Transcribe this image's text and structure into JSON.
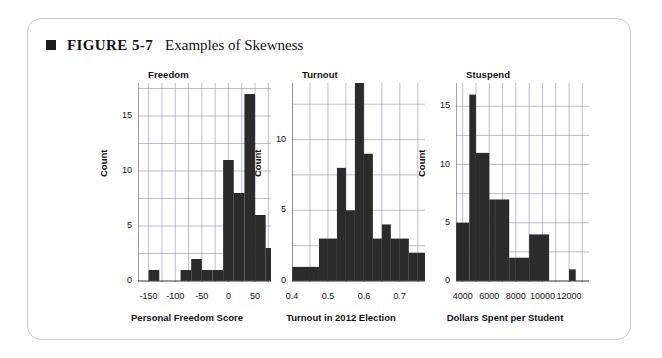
{
  "figure": {
    "bullet": "square-bullet",
    "number": "FIGURE 5-7",
    "title": "Examples of Skewness"
  },
  "chart_data": [
    {
      "type": "bar",
      "title": "Freedom",
      "xlabel": "Personal Freedom Score",
      "ylabel": "Count",
      "grid": true,
      "xlim": [
        -170,
        80
      ],
      "ylim": [
        0,
        18
      ],
      "xticks": [
        "-150",
        "-100",
        "-50",
        "0",
        "50"
      ],
      "xtick_values": [
        -150,
        -100,
        -50,
        0,
        50
      ],
      "yticks": [
        "0",
        "5",
        "10",
        "15"
      ],
      "ytick_values": [
        0,
        5,
        10,
        15
      ],
      "bin_edges": [
        -170,
        -150,
        -130,
        -110,
        -90,
        -70,
        -50,
        -30,
        -10,
        10,
        30,
        50,
        70,
        80
      ],
      "values": [
        0,
        1,
        0,
        0,
        1,
        2,
        1,
        1,
        11,
        8,
        17,
        6,
        3,
        3
      ]
    },
    {
      "type": "bar",
      "title": "Turnout",
      "xlabel": "Turnout in 2012 Election",
      "ylabel": "Count",
      "grid": true,
      "xlim": [
        0.4,
        0.77
      ],
      "ylim": [
        0,
        14
      ],
      "xticks": [
        "0.4",
        "0.5",
        "0.6",
        "0.7"
      ],
      "xtick_values": [
        0.4,
        0.5,
        0.6,
        0.7
      ],
      "yticks": [
        "0",
        "5",
        "10"
      ],
      "ytick_values": [
        0,
        5,
        10
      ],
      "bin_edges": [
        0.4,
        0.425,
        0.45,
        0.475,
        0.5,
        0.525,
        0.55,
        0.575,
        0.6,
        0.625,
        0.65,
        0.675,
        0.7,
        0.725,
        0.75,
        0.77
      ],
      "values": [
        1,
        1,
        1,
        3,
        3,
        8,
        5,
        14,
        9,
        3,
        4,
        3,
        3,
        2,
        2
      ]
    },
    {
      "type": "bar",
      "title": "Stuspend",
      "xlabel": "Dollars Spent per Student",
      "ylabel": "Count",
      "grid": true,
      "xlim": [
        3500,
        13500
      ],
      "ylim": [
        0,
        17
      ],
      "xticks": [
        "4000",
        "6000",
        "8000",
        "10000",
        "12000"
      ],
      "xtick_values": [
        4000,
        6000,
        8000,
        10000,
        12000
      ],
      "yticks": [
        "0",
        "5",
        "10",
        "15"
      ],
      "ytick_values": [
        0,
        5,
        10,
        15
      ],
      "bin_edges": [
        3500,
        4500,
        5000,
        6000,
        6500,
        7500,
        8000,
        9000,
        10500,
        12000,
        12500
      ],
      "values": [
        5,
        16,
        11,
        7,
        7,
        2,
        2,
        4,
        0,
        1
      ]
    }
  ],
  "colors": {
    "bar": "#2b2b2b",
    "grid": "#9aa3b5",
    "axis": "#555555",
    "text": "#111111",
    "card_border": "#c9c9c9",
    "background": "#ffffff"
  }
}
